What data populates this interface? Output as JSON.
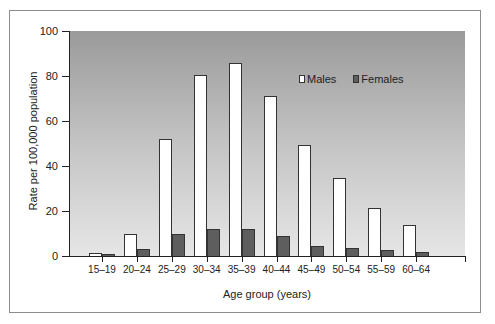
{
  "chart_data": {
    "type": "bar",
    "title": "",
    "xlabel": "Age group (years)",
    "ylabel": "Rate per 100,000 population",
    "ylim": [
      0,
      100
    ],
    "yticks": [
      0,
      20,
      40,
      60,
      80,
      100
    ],
    "grid": false,
    "legend_position": "upper right (inside plot)",
    "categories": [
      "15–19",
      "20–24",
      "25–29",
      "30–34",
      "35–39",
      "40–44",
      "45–49",
      "50–54",
      "55–59",
      "60–64"
    ],
    "series": [
      {
        "name": "Males",
        "color": "#ffffff",
        "values": [
          1.3,
          10,
          52,
          80.5,
          86,
          71,
          49.5,
          34.5,
          21.5,
          14
        ]
      },
      {
        "name": "Females",
        "color": "#5e5e5e",
        "values": [
          1,
          3,
          10,
          12,
          12,
          9,
          4.5,
          3.5,
          2.5,
          2
        ]
      }
    ]
  },
  "axis": {
    "y_title": "Rate per 100,000 population",
    "x_title": "Age group (years)",
    "y_ticks": [
      "0",
      "20",
      "40",
      "60",
      "80",
      "100"
    ]
  },
  "legend": {
    "males": "Males",
    "females": "Females"
  }
}
